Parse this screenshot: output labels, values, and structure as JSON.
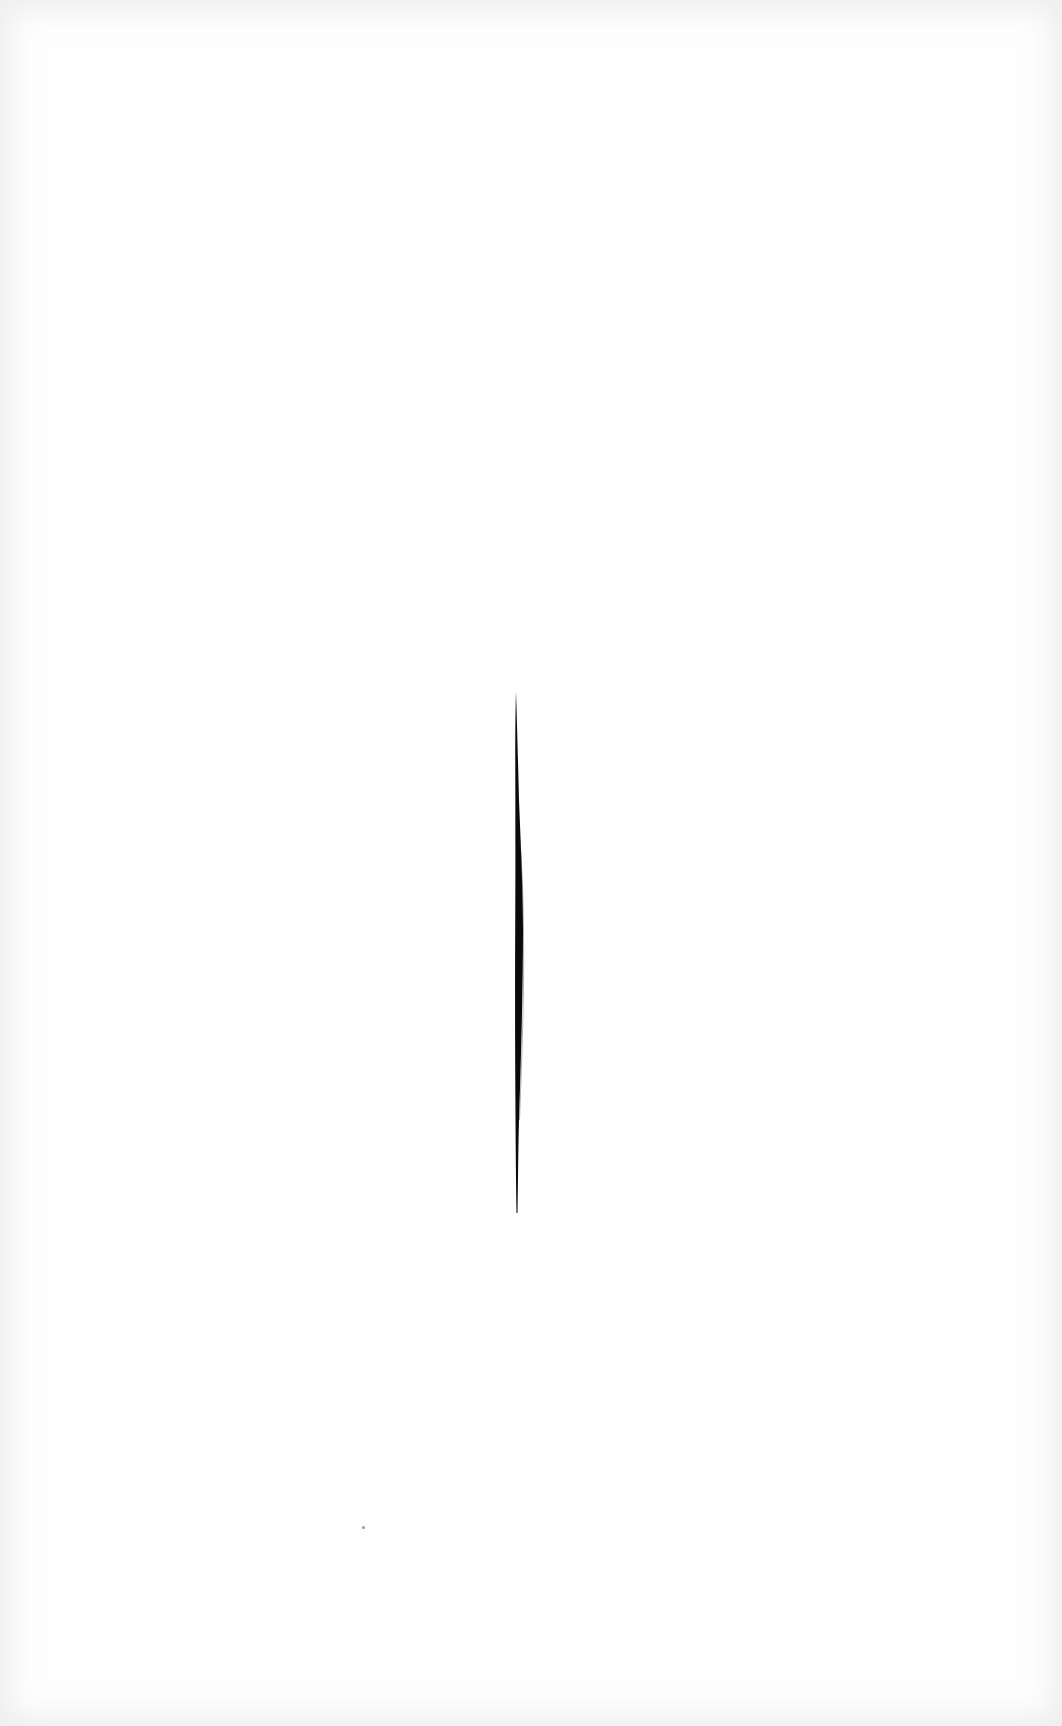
{
  "artwork": {
    "description": "White canvas with a single vertical slash",
    "background_color": "#fefefe",
    "edge_tint_color": "#e6e6e6",
    "slash_color": "#0a0a0a",
    "slash": {
      "top": [
        516,
        692
      ],
      "bottom": [
        517,
        1213
      ],
      "max_width_px": 6
    },
    "speck_color": "#9a9a9a",
    "speck_position": [
      362,
      1526
    ]
  }
}
